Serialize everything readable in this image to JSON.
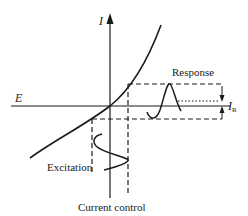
{
  "diagram": {
    "caption": "Current control",
    "axes": {
      "y_label": "I",
      "x_label": "E"
    },
    "labels": {
      "response": "Response",
      "excitation": "Excitation",
      "response_amplitude": "I",
      "response_amplitude_subscript": "R"
    },
    "colors": {
      "ink": "#1a1a1a",
      "background": "#ffffff"
    }
  }
}
